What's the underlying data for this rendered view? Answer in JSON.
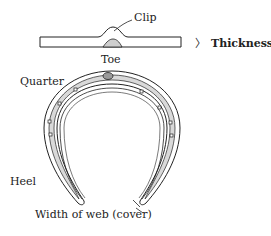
{
  "diagram": {
    "type": "labeled-illustration",
    "colors": {
      "ink": "#222222",
      "shoe_fill": "#d9d9d9",
      "background": "#ffffff"
    },
    "side_view": {
      "labels": {
        "clip": "Clip",
        "thickness_bracket": "〉",
        "thickness": "Thickness"
      }
    },
    "top_view": {
      "labels": {
        "toe": "Toe",
        "quarter": "Quarter",
        "heel": "Heel",
        "web": "Width of web (cover)"
      },
      "nail_holes": 8
    }
  }
}
